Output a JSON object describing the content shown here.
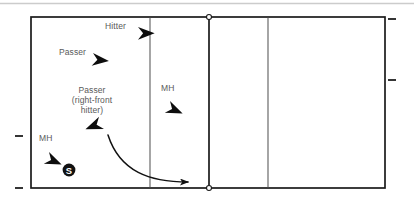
{
  "diagram": {
    "type": "volleyball-court-play-diagram",
    "title": "",
    "court": {
      "outline_color": "#1a1a1a",
      "line_color": "#3a3a3a",
      "fill_color": "#ffffff",
      "left": 31,
      "top": 17,
      "right": 385,
      "bottom": 188,
      "attack_line_left_x": 150,
      "center_line_x": 209,
      "attack_line_right_x": 268,
      "net_post_marker": "circle"
    },
    "top_rule_color": "#cccccc",
    "tick_color": "#2b2b2b",
    "ticks": [
      {
        "name": "tick-right-top",
        "side": "right",
        "x": 392,
        "y": 19
      },
      {
        "name": "tick-right-middle",
        "side": "right",
        "x": 392,
        "y": 80
      },
      {
        "name": "tick-left-middle",
        "side": "left",
        "x": 19,
        "y": 136
      },
      {
        "name": "tick-left-bottom",
        "side": "left",
        "x": 19,
        "y": 188
      }
    ],
    "players": [
      {
        "id": "hitter",
        "label": "Hitter",
        "label_x": 105,
        "label_y": 21,
        "marker": "dart-arrow",
        "marker_x": 138,
        "marker_y": 27,
        "direction": "right"
      },
      {
        "id": "passer-left",
        "label": "Passer",
        "label_x": 59,
        "label_y": 47,
        "marker": "dart-arrow",
        "marker_x": 93,
        "marker_y": 53,
        "direction": "right"
      },
      {
        "id": "passer-right-front-hitter",
        "label": "Passer (right-front hitter)",
        "label_lines": [
          "Passer",
          "(right-front",
          "hitter)"
        ],
        "label_x": 60,
        "label_y": 85,
        "marker": "dart-arrow",
        "marker_x": 104,
        "marker_y": 129,
        "direction": "down-left"
      },
      {
        "id": "middle-hitter-front",
        "label": "MH",
        "label_x": 161,
        "label_y": 83,
        "marker": "dart-arrow",
        "marker_x": 170,
        "marker_y": 101,
        "direction": "down-right"
      },
      {
        "id": "middle-hitter-back",
        "label": "MH",
        "label_x": 39,
        "label_y": 133,
        "marker": "dart-arrow",
        "marker_x": 49,
        "marker_y": 152,
        "direction": "down-right"
      },
      {
        "id": "setter",
        "label": "S",
        "marker": "filled-circle-letter",
        "marker_x": 69,
        "marker_y": 170,
        "radius": 6.5,
        "fill": "#111111",
        "text_color": "#ffffff"
      }
    ],
    "movement_path": {
      "id": "setter-transition-path",
      "description": "curved arrow from right-front hitter toward right sideline zone",
      "start_x": 108,
      "start_y": 135,
      "control1_x": 120,
      "control1_y": 172,
      "control2_x": 150,
      "control2_y": 182,
      "end_x": 192,
      "end_y": 182,
      "color": "#111111",
      "arrowhead": "line-arrow"
    }
  }
}
